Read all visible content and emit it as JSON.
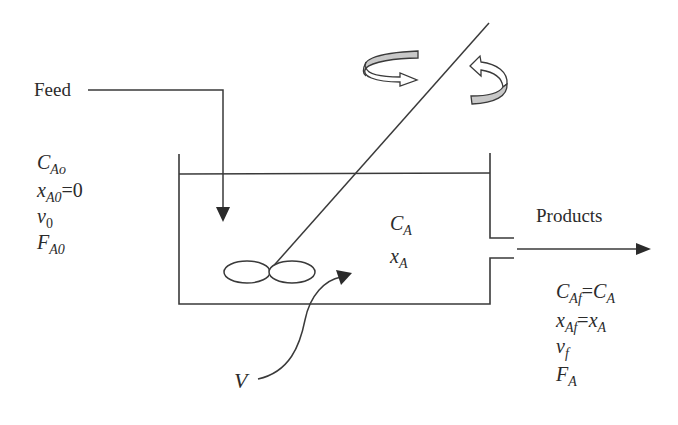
{
  "diagram": {
    "colors": {
      "line": "#3a3a3a",
      "rotation_band_fill": "#c8c8c8",
      "text": "#2b2b2b",
      "background": "#ffffff"
    },
    "feed": {
      "label": "Feed",
      "vars": [
        {
          "sym": "C",
          "sub": "Ao",
          "rest": ""
        },
        {
          "sym": "x",
          "sub": "A0",
          "rest": "=0"
        },
        {
          "sym": "v",
          "sub": "0",
          "rest": ""
        },
        {
          "sym": "F",
          "sub": "A0",
          "rest": ""
        }
      ]
    },
    "tank": {
      "vars": [
        {
          "sym": "C",
          "sub": "A"
        },
        {
          "sym": "x",
          "sub": "A"
        }
      ],
      "volume_label": "V"
    },
    "products": {
      "label": "Products",
      "vars": [
        {
          "sym": "C",
          "sub": "Af",
          "rest_sym": "C",
          "rest_sub": "A"
        },
        {
          "sym": "x",
          "sub": "Af",
          "rest_sym": "x",
          "rest_sub": "A"
        },
        {
          "sym": "v",
          "sub": "f"
        },
        {
          "sym": "F",
          "sub": "A"
        }
      ]
    },
    "icons": [
      "rotation-arrow-clockwise-icon",
      "rotation-arrow-counterclockwise-icon",
      "impeller-icon"
    ]
  }
}
